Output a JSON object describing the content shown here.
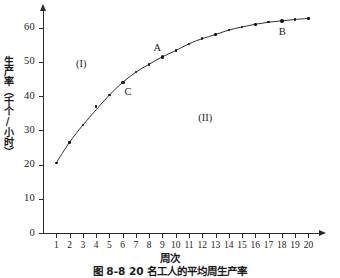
{
  "chart_data": {
    "type": "scatter",
    "title": "",
    "caption": "图 8-8  20 名工人的平均周生产率",
    "xlabel": "周次",
    "ylabel": "生产率（千个/小时）",
    "xlim": [
      0,
      20.8
    ],
    "ylim": [
      0,
      64
    ],
    "grid": false,
    "legend_position": "none",
    "xticks": [
      1,
      2,
      3,
      4,
      5,
      6,
      7,
      8,
      9,
      10,
      11,
      12,
      13,
      14,
      15,
      16,
      17,
      18,
      19,
      20
    ],
    "xtick_labels": [
      "1",
      "2",
      "3",
      "4",
      "5",
      "6",
      "7",
      "8",
      "9",
      "10",
      "11",
      "12",
      "13",
      "14",
      "15",
      "16",
      "17",
      "18",
      "19",
      "20"
    ],
    "yticks": [
      0,
      10,
      20,
      30,
      40,
      50,
      60
    ],
    "ytick_labels": [
      "0",
      "10",
      "20",
      "30",
      "40",
      "50",
      "60"
    ],
    "x": [
      1,
      2,
      3,
      4,
      5,
      6,
      7,
      8,
      9,
      10,
      11,
      12,
      13,
      14,
      15,
      16,
      17,
      18,
      19,
      20
    ],
    "values": [
      20.5,
      26.5,
      31.5,
      37.0,
      40.3,
      44.0,
      47.0,
      49.3,
      51.5,
      53.3,
      55.3,
      56.8,
      58.0,
      59.3,
      60.2,
      61.0,
      61.6,
      62.0,
      62.4,
      62.7
    ],
    "series": [
      {
        "name": "平均周生产率",
        "values": [
          20.5,
          26.5,
          31.5,
          37.0,
          40.3,
          44.0,
          47.0,
          49.3,
          51.5,
          53.3,
          55.3,
          56.8,
          58.0,
          59.3,
          60.2,
          61.0,
          61.6,
          62.0,
          62.4,
          62.7
        ]
      }
    ],
    "fitted_curve": {
      "description": "learning curve fitted through the data points",
      "x": [
        1,
        2,
        3,
        4,
        5,
        6,
        7,
        8,
        9,
        10,
        11,
        12,
        13,
        14,
        15,
        16,
        17,
        18,
        19,
        20
      ],
      "y": [
        20.5,
        26.5,
        31.5,
        36.0,
        40.3,
        44.0,
        47.0,
        49.3,
        51.5,
        53.3,
        55.3,
        56.8,
        58.0,
        59.3,
        60.2,
        61.0,
        61.6,
        62.0,
        62.4,
        62.7
      ]
    },
    "highlighted_points": [
      {
        "label": "A",
        "x": 9,
        "y": 51.5
      },
      {
        "label": "B",
        "x": 18,
        "y": 62.0
      },
      {
        "label": "C",
        "x": 6,
        "y": 44.0
      }
    ],
    "region_labels": [
      {
        "label": "(I)",
        "x": 3.1,
        "y": 49.5
      },
      {
        "label": "(II)",
        "x": 12.3,
        "y": 33.5
      }
    ],
    "annotations": [
      {
        "label": "A",
        "near": "point A",
        "position": "above-left"
      },
      {
        "label": "B",
        "near": "point B",
        "position": "below"
      },
      {
        "label": "C",
        "near": "point C",
        "position": "below-right"
      },
      {
        "label": "(I)",
        "near": "upper-left region",
        "position": "inside"
      },
      {
        "label": "(II)",
        "near": "lower-right region",
        "position": "inside"
      }
    ],
    "colors": {
      "axis": "#2b2b2b",
      "curve": "#1a1a1a",
      "marker": "#111111",
      "background": "#ffffff"
    }
  }
}
